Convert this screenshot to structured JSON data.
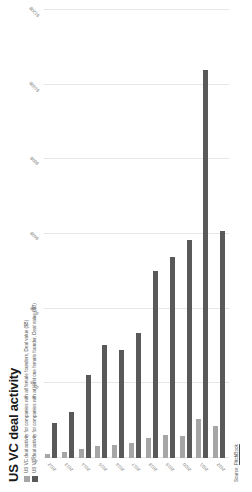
{
  "chart_data": {
    "type": "bar",
    "orientation": "horizontal",
    "title": "US VC deal activity",
    "xlabel": "",
    "ylabel": "",
    "categories": [
      "2012",
      "2013",
      "2014",
      "2015",
      "2016",
      "2017",
      "2018",
      "2019",
      "2020",
      "2021",
      "2022"
    ],
    "series": [
      {
        "name": "US VC deal activity for companies with all female founders, Deal value ($B)",
        "color": "#a6a6a6",
        "values": [
          1.2,
          1.6,
          2.4,
          3.2,
          3.6,
          3.9,
          5.4,
          6.1,
          5.9,
          10.4,
          8.6
        ]
      },
      {
        "name": "US VC deal activity for companies with at least one female founder, Deal value ($B)",
        "color": "#595959",
        "values": [
          9.5,
          12.4,
          22.1,
          30.2,
          28.9,
          33.6,
          50.1,
          53.8,
          58.4,
          104.0,
          60.8
        ]
      }
    ],
    "xlim": [
      0,
      120
    ],
    "xticks": [
      "$0B",
      "$20B",
      "$40B",
      "$60B",
      "$80B",
      "$100B",
      "$120B"
    ],
    "xtick_values": [
      0,
      20,
      40,
      60,
      80,
      100,
      120
    ],
    "grid": true,
    "legend_position": "top-left"
  },
  "legend": {
    "entries": [
      {
        "label": "US VC deal activity for companies with all female founders, Deal value ($B)",
        "color": "#a6a6a6"
      },
      {
        "label": "US VC deal activity for companies with at least one female founder, Deal value ($B)",
        "color": "#595959"
      }
    ]
  },
  "source": {
    "prefix": "Source: ",
    "name": "PitchBook"
  }
}
